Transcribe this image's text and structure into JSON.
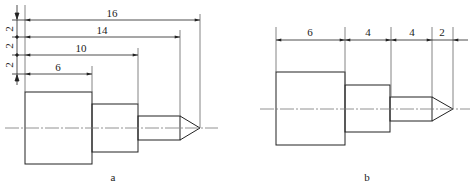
{
  "figures": [
    {
      "id": "a",
      "caption": "a",
      "dimension_style": "baseline (parallel) dimensioning",
      "horizontal_dims": [
        "16",
        "14",
        "10",
        "6"
      ],
      "vertical_spacing_dims": [
        "2",
        "2",
        "2"
      ]
    },
    {
      "id": "b",
      "caption": "b",
      "dimension_style": "chain dimensioning",
      "horizontal_dims": [
        "6",
        "4",
        "4",
        "2"
      ]
    }
  ],
  "colors": {
    "line": "#222222",
    "extension": "#666666",
    "centerline": "#777777",
    "background": "#ffffff"
  }
}
